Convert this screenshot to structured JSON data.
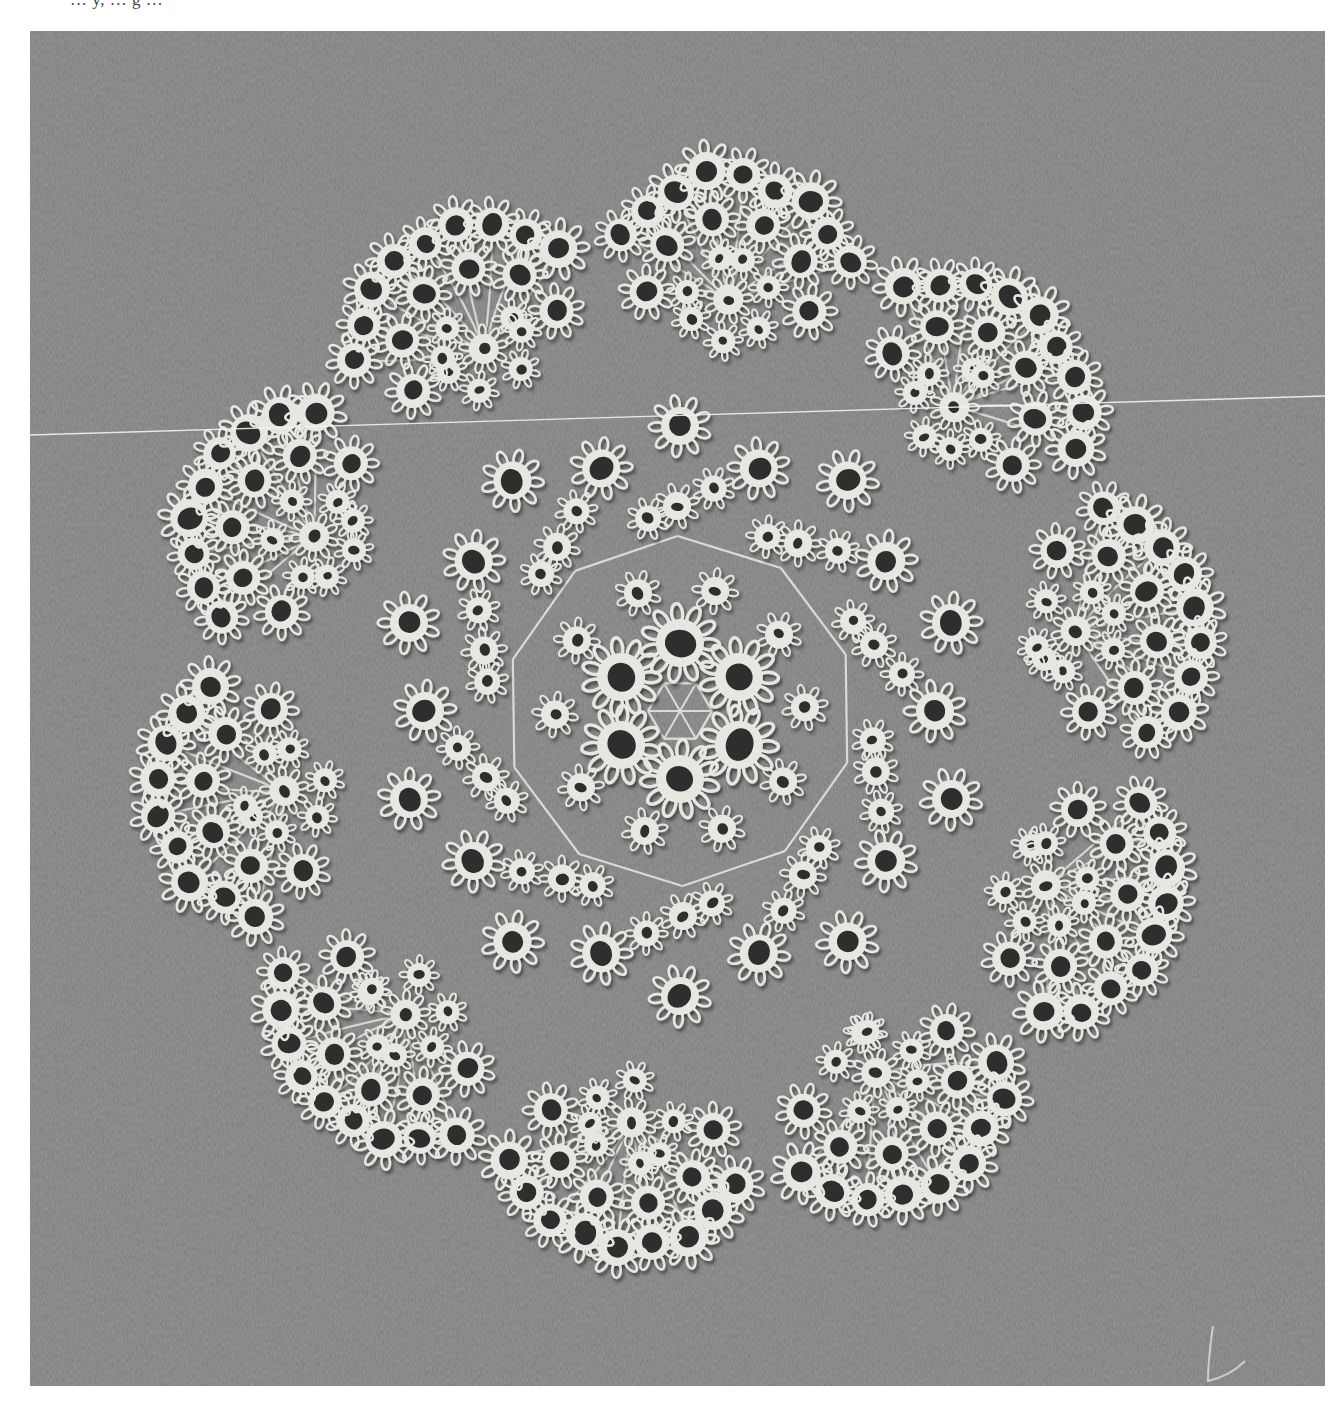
{
  "page": {
    "background": "#ffffff",
    "caption_partial": "… y,  … g …"
  },
  "photo": {
    "subject": "tatted lace doily",
    "style": "black-and-white halftone photograph",
    "frame": {
      "x": 30,
      "y": 31,
      "width": 1295,
      "height": 1355
    },
    "background_color": "#7a7a7a",
    "background_texture": "ribbed fabric / card with vertical grain",
    "lace_color": "#e8e6e0",
    "lace_shadow_color": "#3a3a3a",
    "hole_color": "#2e2e2e",
    "doily": {
      "center": {
        "x": 650,
        "y": 680
      },
      "outer_lobes": 10,
      "outer_radius": 560,
      "center_motif": "6 large rings around hexagonal thread mesh",
      "inner_frame": "decagonal thread frame with small flowers at vertices"
    },
    "artifacts": {
      "scan_line": {
        "x1": 0,
        "y1": 404,
        "x2": 1295,
        "y2": 365,
        "color": "#f2f2f2"
      },
      "loose_thread": {
        "location": "bottom-right corner"
      }
    }
  }
}
